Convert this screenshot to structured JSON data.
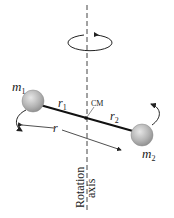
{
  "diagram": {
    "labels": {
      "mass1": "m",
      "mass1_sub": "1",
      "mass2": "m",
      "mass2_sub": "2",
      "radius1": "r",
      "radius1_sub": "1",
      "radius2": "r",
      "radius2_sub": "2",
      "distance": "r",
      "center_of_mass": "CM",
      "axis_line1": "Rotation",
      "axis_line2": "axis"
    },
    "colors": {
      "sphere": "#b8b8b8",
      "sphere_edge": "#888888",
      "rod": "#111111",
      "axis": "#444444"
    }
  }
}
